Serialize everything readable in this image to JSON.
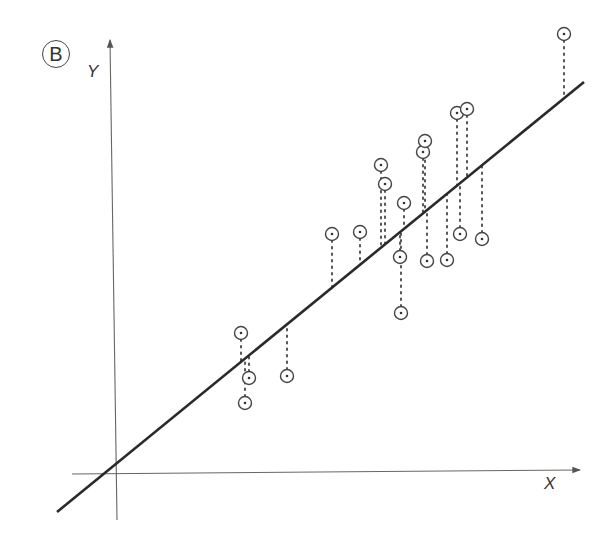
{
  "figure": {
    "panel_label": "B",
    "y_axis_label": "Y",
    "x_axis_label": "X",
    "colors": {
      "axis": "#555555",
      "regression_line": "#2a2a2a",
      "points": "#444444",
      "residuals": "#555555",
      "background": "#ffffff"
    }
  },
  "chart_data": {
    "type": "scatter",
    "title": "",
    "panel": "B",
    "xlabel": "X",
    "ylabel": "Y",
    "grid": false,
    "legend": null,
    "regression_line": {
      "from_px": [
        57,
        512
      ],
      "to_px": [
        584,
        82
      ]
    },
    "points_px": [
      {
        "x": 241,
        "y": 333
      },
      {
        "x": 249,
        "y": 378
      },
      {
        "x": 245,
        "y": 403
      },
      {
        "x": 287,
        "y": 376
      },
      {
        "x": 332,
        "y": 234
      },
      {
        "x": 360,
        "y": 232
      },
      {
        "x": 381,
        "y": 165
      },
      {
        "x": 385,
        "y": 184
      },
      {
        "x": 404,
        "y": 203
      },
      {
        "x": 400,
        "y": 257
      },
      {
        "x": 401,
        "y": 313
      },
      {
        "x": 423,
        "y": 152
      },
      {
        "x": 425,
        "y": 141
      },
      {
        "x": 427,
        "y": 261
      },
      {
        "x": 447,
        "y": 260
      },
      {
        "x": 457,
        "y": 113
      },
      {
        "x": 467,
        "y": 109
      },
      {
        "x": 460,
        "y": 234
      },
      {
        "x": 482,
        "y": 239
      },
      {
        "x": 564,
        "y": 34
      }
    ]
  }
}
